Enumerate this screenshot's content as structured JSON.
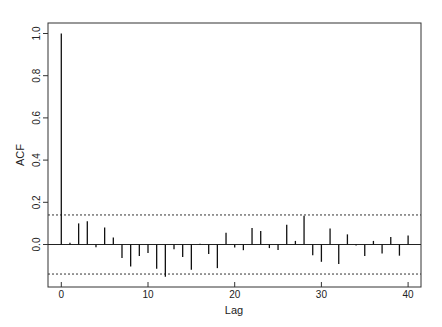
{
  "chart_data": {
    "type": "bar",
    "subtype": "acf-stem",
    "title": "",
    "xlabel": "Lag",
    "ylabel": "ACF",
    "xlim": [
      0,
      40
    ],
    "ylim": [
      -0.17,
      1.0
    ],
    "x_ticks": [
      0,
      10,
      20,
      30,
      40
    ],
    "y_ticks": [
      "0.0",
      "0.2",
      "0.4",
      "0.6",
      "0.8",
      "1.0"
    ],
    "confidence_bound": 0.14,
    "grid": false,
    "legend": null,
    "x": [
      0,
      1,
      2,
      3,
      4,
      5,
      6,
      7,
      8,
      9,
      10,
      11,
      12,
      13,
      14,
      15,
      16,
      17,
      18,
      19,
      20,
      21,
      22,
      23,
      24,
      25,
      26,
      27,
      28,
      29,
      30,
      31,
      32,
      33,
      34,
      35,
      36,
      37,
      38,
      39,
      40
    ],
    "values": [
      1.0,
      0.008,
      0.1,
      0.11,
      -0.013,
      0.08,
      0.033,
      -0.064,
      -0.104,
      -0.054,
      -0.04,
      -0.115,
      -0.153,
      -0.023,
      -0.059,
      -0.12,
      0.004,
      -0.045,
      -0.112,
      0.056,
      -0.014,
      -0.027,
      0.078,
      0.064,
      -0.017,
      -0.026,
      0.094,
      0.017,
      0.136,
      -0.051,
      -0.082,
      0.076,
      -0.092,
      0.048,
      -0.005,
      -0.054,
      0.017,
      -0.043,
      0.036,
      -0.053,
      0.043
    ]
  }
}
